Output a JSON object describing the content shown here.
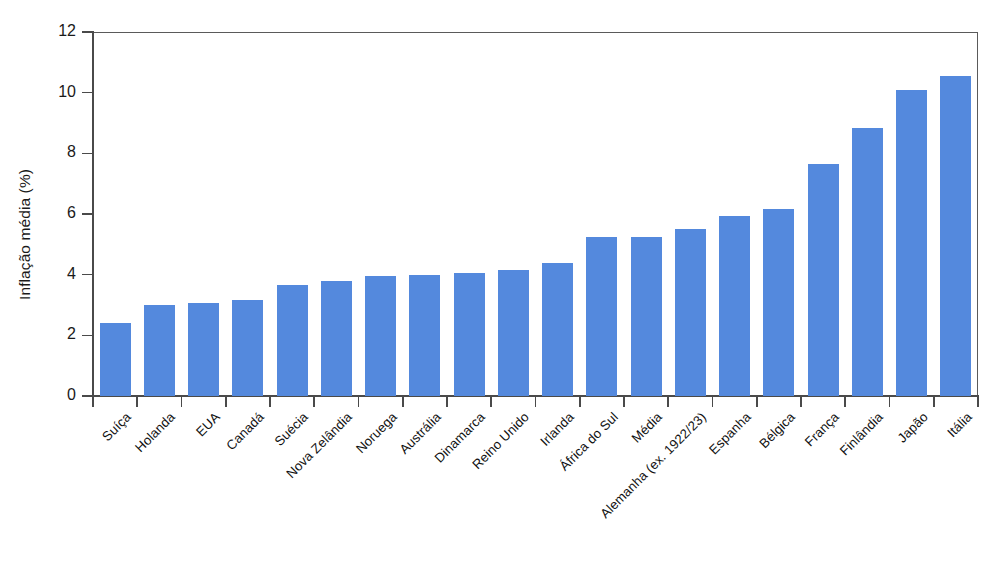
{
  "chart_data": {
    "type": "bar",
    "title": "",
    "subtitle": "",
    "xlabel": "",
    "ylabel": "Inflação média (%)",
    "ylim": [
      0,
      12
    ],
    "ytick_values": [
      0,
      2,
      4,
      6,
      8,
      10,
      12
    ],
    "ytick_labels": [
      "0",
      "2",
      "4",
      "6",
      "8",
      "10",
      "12"
    ],
    "grid": false,
    "legend": null,
    "bar_color": "#5489dd",
    "axis_color": "#4a4a4a",
    "categories": [
      "Suíça",
      "Holanda",
      "EUA",
      "Canadá",
      "Suécia",
      "Nova Zelândia",
      "Noruega",
      "Austrália",
      "Dinamarca",
      "Reino Unido",
      "Irlanda",
      "África do Sul",
      "Média",
      "Alemanha (ex. 1922/23)",
      "Espanha",
      "Bélgica",
      "França",
      "Finlândia",
      "Japão",
      "Itália"
    ],
    "values": [
      2.4,
      3.0,
      3.05,
      3.15,
      3.65,
      3.8,
      3.95,
      4.0,
      4.05,
      4.15,
      4.4,
      5.25,
      5.25,
      5.5,
      5.95,
      6.15,
      7.65,
      8.85,
      10.1,
      10.55
    ],
    "series": [
      {
        "name": "Inflação média (%)",
        "values": [
          2.4,
          3.0,
          3.05,
          3.15,
          3.65,
          3.8,
          3.95,
          4.0,
          4.05,
          4.15,
          4.4,
          5.25,
          5.25,
          5.5,
          5.95,
          6.15,
          7.65,
          8.85,
          10.1,
          10.55
        ]
      }
    ]
  }
}
